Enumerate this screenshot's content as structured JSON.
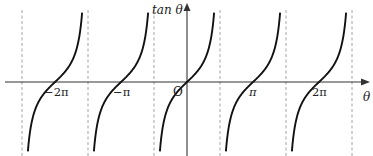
{
  "chart_data": {
    "type": "line",
    "title": "",
    "function": "tan θ",
    "xlabel": "θ",
    "ylabel": "tan θ",
    "origin_label": "O",
    "x_ticks": [
      {
        "value": -6.2832,
        "label": "−2π"
      },
      {
        "value": -3.1416,
        "label": "−π"
      },
      {
        "value": 3.1416,
        "label": "π"
      },
      {
        "value": 6.2832,
        "label": "2π"
      }
    ],
    "asymptotes": [
      -7.854,
      -4.712,
      -1.571,
      1.571,
      4.712,
      7.854
    ],
    "asymptote_labels": [
      "−5π/2",
      "−3π/2",
      "−π/2",
      "π/2",
      "3π/2",
      "5π/2"
    ],
    "xlim": [
      -8.4,
      8.4
    ],
    "ylim": [
      -3.5,
      3.5
    ],
    "grid": false,
    "legend": null,
    "series": [
      {
        "name": "tan θ",
        "branch_centers": [
          -6.2832,
          -3.1416,
          0,
          3.1416,
          6.2832
        ],
        "color": "#111111"
      }
    ]
  },
  "labels": {
    "y_axis": "tan θ",
    "x_axis": "θ",
    "origin": "O",
    "tick_m2pi": "−2π",
    "tick_mpi": "−π",
    "tick_pi": "π",
    "tick_2pi": "2π"
  },
  "colors": {
    "curve": "#111111",
    "axis": "#333333",
    "asymptote": "#9a9a9a"
  }
}
